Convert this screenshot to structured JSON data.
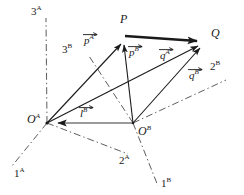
{
  "figure": {
    "background_color": "#ffffff",
    "ink_color": "#1a1a1a",
    "translation_vector_color": "#8c8c8c",
    "axes": [
      {
        "name": "axis-1A",
        "label_base": "1",
        "label_sup": "A"
      },
      {
        "name": "axis-2A",
        "label_base": "2",
        "label_sup": "A"
      },
      {
        "name": "axis-3A",
        "label_base": "3",
        "label_sup": "A"
      },
      {
        "name": "axis-1B",
        "label_base": "1",
        "label_sup": "B"
      },
      {
        "name": "axis-2B",
        "label_base": "2",
        "label_sup": "B"
      },
      {
        "name": "axis-3B",
        "label_base": "3",
        "label_sup": "B"
      }
    ],
    "points": [
      {
        "name": "point-P",
        "label_base": "P",
        "label_sup": ""
      },
      {
        "name": "point-Q",
        "label_base": "Q",
        "label_sup": ""
      },
      {
        "name": "origin-A",
        "label_base": "O",
        "label_sup": "A"
      },
      {
        "name": "origin-B",
        "label_base": "O",
        "label_sup": "B"
      }
    ],
    "vectors": [
      {
        "name": "vector-pA",
        "label_base": "p",
        "label_sup": "A",
        "from": "origin-A",
        "to": "point-P"
      },
      {
        "name": "vector-pB",
        "label_base": "p",
        "label_sup": "B",
        "from": "origin-B",
        "to": "point-P"
      },
      {
        "name": "vector-qA",
        "label_base": "q",
        "label_sup": "A",
        "from": "origin-A",
        "to": "point-Q"
      },
      {
        "name": "vector-qB",
        "label_base": "q",
        "label_sup": "B",
        "from": "origin-B",
        "to": "point-Q"
      },
      {
        "name": "vector-lB",
        "label_base": "l",
        "label_sup": "B",
        "from": "origin-B",
        "to": "origin-A"
      },
      {
        "name": "vector-PQ",
        "label_base": "",
        "label_sup": "",
        "from": "point-P",
        "to": "point-Q"
      }
    ]
  }
}
